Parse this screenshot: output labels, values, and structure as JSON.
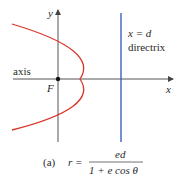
{
  "diagram": {
    "axis_labels": {
      "y": "y",
      "x": "x",
      "axis": "axis",
      "focus": "F"
    },
    "directrix": {
      "equation": "x = d",
      "label": "directrix"
    },
    "caption": {
      "prefix": "(a)",
      "lhs": "r =",
      "numerator": "ed",
      "denominator": "1 + e cos θ"
    },
    "colors": {
      "parabola": "#d9352b",
      "directrix": "#3a5fc8",
      "axes": "#555555"
    }
  }
}
